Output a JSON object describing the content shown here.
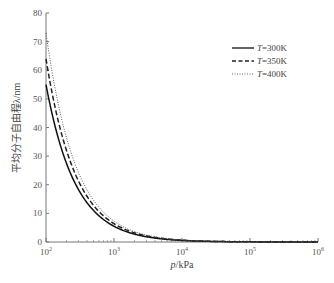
{
  "chart_data": {
    "type": "line",
    "title": "",
    "xlabel": "p/kPa",
    "ylabel": "平均分子自由程λ/nm",
    "xscale": "log",
    "xlim": [
      100,
      1000000
    ],
    "ylim": [
      0,
      80
    ],
    "x_ticks": [
      "10^2",
      "10^3",
      "10^4",
      "10^5",
      "10^6"
    ],
    "y_ticks": [
      0,
      10,
      20,
      30,
      40,
      50,
      60,
      70,
      80
    ],
    "legend_position": "upper right",
    "grid": false,
    "x": [
      100,
      150,
      200,
      300,
      500,
      1000,
      2000,
      5000,
      10000,
      100000,
      1000000
    ],
    "series": [
      {
        "name": "T=300K",
        "style": "solid",
        "values": [
          55.0,
          36.7,
          27.5,
          18.3,
          11.0,
          5.5,
          2.75,
          1.1,
          0.55,
          0.055,
          0.0055
        ]
      },
      {
        "name": "T=350K",
        "style": "dashed",
        "values": [
          64.0,
          42.7,
          32.0,
          21.3,
          12.8,
          6.4,
          3.2,
          1.28,
          0.64,
          0.064,
          0.0064
        ]
      },
      {
        "name": "T=400K",
        "style": "dotted",
        "values": [
          73.0,
          48.7,
          36.5,
          24.3,
          14.6,
          7.3,
          3.65,
          1.46,
          0.73,
          0.073,
          0.0073
        ]
      }
    ]
  },
  "labels": {
    "xlabel_italic": "p",
    "xlabel_unit": "/kPa",
    "ylabel": "平均分子自由程λ/nm",
    "legend": [
      {
        "italic": "T",
        "rest": "=300K"
      },
      {
        "italic": "T",
        "rest": "=350K"
      },
      {
        "italic": "T",
        "rest": "=400K"
      }
    ],
    "x_tick_base": "10",
    "x_tick_exps": [
      "2",
      "3",
      "4",
      "5",
      "6"
    ],
    "y_ticks": [
      "0",
      "10",
      "20",
      "30",
      "40",
      "50",
      "60",
      "70",
      "80"
    ]
  }
}
